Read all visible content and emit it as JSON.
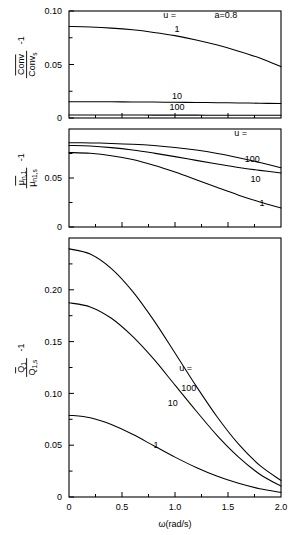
{
  "figure": {
    "annotation_a": "a=0.8",
    "xaxis": {
      "label": "ω(rad/s)",
      "ticks": [
        "0",
        "0.5",
        "1.0",
        "1.5",
        "2.0"
      ],
      "tick_values": [
        0,
        0.5,
        1.0,
        1.5,
        2.0
      ],
      "range": [
        0,
        2.0
      ],
      "minor_between": 1
    }
  },
  "chart_data": [
    {
      "type": "line",
      "panel": "top",
      "title": "",
      "xlabel": "",
      "ylabel_numerator": "Conv",
      "ylabel_denominator": "Conv",
      "ylabel_denominator_sub": "s",
      "ylabel_suffix": "-1",
      "ylabel_plain": "Conv / Conv_s - 1",
      "xlim": [
        0,
        2.0
      ],
      "ylim": [
        0,
        0.1
      ],
      "yticks": [
        0,
        0.05,
        0.1
      ],
      "ytick_labels": [
        "0",
        "0.05",
        "0.10"
      ],
      "grid": false,
      "legend_title": "u =",
      "annotations": [
        {
          "text": "a=0.8",
          "x": 1.48,
          "y": 0.093
        },
        {
          "text": "u =",
          "x": 0.95,
          "y": 0.093
        }
      ],
      "x": [
        0,
        0.2,
        0.4,
        0.6,
        0.8,
        1.0,
        1.2,
        1.4,
        1.6,
        1.8,
        2.0
      ],
      "series": [
        {
          "name": "1",
          "label": "1",
          "label_at": {
            "x": 1.02,
            "y": 0.0805
          },
          "values": [
            0.0855,
            0.085,
            0.084,
            0.0824,
            0.08,
            0.077,
            0.073,
            0.0682,
            0.0625,
            0.056,
            0.048
          ]
        },
        {
          "name": "10",
          "label": "10",
          "label_at": {
            "x": 1.02,
            "y": 0.0175
          },
          "values": [
            0.0152,
            0.0152,
            0.0151,
            0.015,
            0.0149,
            0.0147,
            0.0145,
            0.0143,
            0.0141,
            0.0138,
            0.0135
          ]
        },
        {
          "name": "100",
          "label": "100",
          "label_at": {
            "x": 1.02,
            "y": 0.0075
          },
          "values": [
            0.0028,
            0.0028,
            0.0028,
            0.0028,
            0.0027,
            0.0027,
            0.0027,
            0.0026,
            0.0026,
            0.0025,
            0.0025
          ]
        }
      ]
    },
    {
      "type": "line",
      "panel": "middle",
      "title": "",
      "xlabel": "",
      "ylabel_numerator": "μ",
      "ylabel_numerator_sub": "n,1",
      "ylabel_denominator": "μ",
      "ylabel_denominator_sub": "n1,s",
      "ylabel_suffix": "-1",
      "ylabel_plain": "μ_n,1 / μ_n1,s - 1",
      "xlim": [
        0,
        2.0
      ],
      "ylim": [
        0,
        0.1
      ],
      "yticks": [
        0,
        0.05
      ],
      "ytick_labels": [
        "0",
        "0.05"
      ],
      "grid": false,
      "legend_title": "u =",
      "annotations": [
        {
          "text": "u =",
          "x": 1.62,
          "y": 0.0925
        }
      ],
      "x": [
        0,
        0.2,
        0.4,
        0.6,
        0.8,
        1.0,
        1.2,
        1.4,
        1.6,
        1.8,
        2.0
      ],
      "series": [
        {
          "name": "100",
          "label": "100",
          "label_at": {
            "x": 1.73,
            "y": 0.0665
          },
          "values": [
            0.086,
            0.0858,
            0.0853,
            0.0845,
            0.0832,
            0.0812,
            0.0785,
            0.075,
            0.0707,
            0.0658,
            0.0605
          ]
        },
        {
          "name": "10",
          "label": "10",
          "label_at": {
            "x": 1.76,
            "y": 0.046
          },
          "values": [
            0.0832,
            0.0826,
            0.081,
            0.0786,
            0.0754,
            0.0718,
            0.068,
            0.0643,
            0.0608,
            0.0578,
            0.0552
          ]
        },
        {
          "name": "1",
          "label": "1",
          "label_at": {
            "x": 1.82,
            "y": 0.0215
          },
          "values": [
            0.076,
            0.0752,
            0.0728,
            0.0688,
            0.063,
            0.056,
            0.0482,
            0.0402,
            0.0325,
            0.0256,
            0.0195
          ]
        }
      ]
    },
    {
      "type": "line",
      "panel": "bottom",
      "title": "",
      "xlabel": "ω(rad/s)",
      "ylabel_numerator": "Q",
      "ylabel_numerator_sub": "1",
      "ylabel_denominator": "Q",
      "ylabel_denominator_sub": "1,s",
      "ylabel_suffix": "-1",
      "ylabel_plain": "Q_1 / Q_1,s - 1",
      "xlim": [
        0,
        2.0
      ],
      "ylim": [
        0,
        0.25
      ],
      "yticks": [
        0,
        0.05,
        0.1,
        0.15,
        0.2
      ],
      "ytick_labels": [
        "0",
        "0.05",
        "0.10",
        "0.15",
        "0.20"
      ],
      "grid": false,
      "legend_title": "u =",
      "annotations": [
        {
          "text": "u =",
          "x": 1.1,
          "y": 0.122
        }
      ],
      "x": [
        0,
        0.2,
        0.4,
        0.6,
        0.8,
        1.0,
        1.2,
        1.4,
        1.6,
        1.8,
        2.0
      ],
      "series": [
        {
          "name": "100",
          "label": "100",
          "label_at": {
            "x": 1.13,
            "y": 0.102
          },
          "values": [
            0.2395,
            0.2345,
            0.2205,
            0.1985,
            0.1705,
            0.139,
            0.107,
            0.077,
            0.051,
            0.0305,
            0.016
          ]
        },
        {
          "name": "10",
          "label": "10",
          "label_at": {
            "x": 0.98,
            "y": 0.088
          },
          "values": [
            0.1875,
            0.1835,
            0.1725,
            0.155,
            0.133,
            0.108,
            0.083,
            0.059,
            0.0385,
            0.022,
            0.0105
          ]
        },
        {
          "name": "1",
          "label": "1",
          "label_at": {
            "x": 0.82,
            "y": 0.047
          },
          "values": [
            0.079,
            0.0765,
            0.07,
            0.0605,
            0.0495,
            0.0385,
            0.0285,
            0.02,
            0.0132,
            0.008,
            0.0045
          ]
        }
      ]
    }
  ]
}
